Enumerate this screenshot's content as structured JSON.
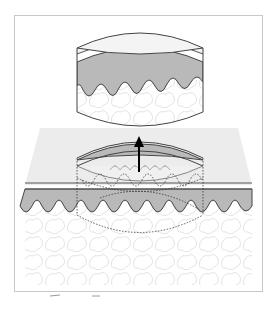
{
  "figure": {
    "type": "diagram",
    "labels": []
  },
  "colors": {
    "background": "#ffffff",
    "frame": "#c8c8c8",
    "plane": "#ececec",
    "epidermis_top": "#f1f1f1",
    "stratum_line": "#555555",
    "dermis": "#b9b9b9",
    "subcutis": "#ffffff",
    "cell_outline": "#e4e4e4",
    "outline": "#444444",
    "arrow": "#000000"
  },
  "elements": {
    "plug": "lifted cylindrical skin sample",
    "hole": "cut-out site in skin surface",
    "arrow": "upward extraction arrow"
  }
}
